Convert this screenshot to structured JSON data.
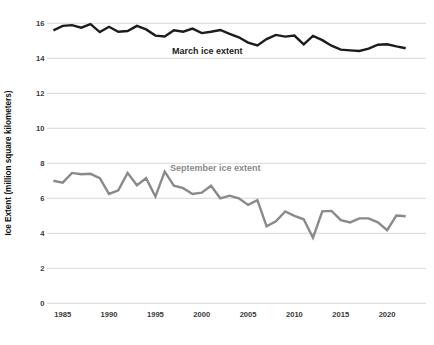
{
  "chart_data": {
    "type": "line",
    "title": "",
    "xlabel": "",
    "ylabel": "Ice Extent (million square kilometers)",
    "ylim": [
      0,
      16
    ],
    "xlim": [
      1983.5,
      2023.5
    ],
    "grid": "horizontal-only",
    "legend_position": "inline-annotations",
    "x": [
      1984,
      1985,
      1986,
      1987,
      1988,
      1989,
      1990,
      1991,
      1992,
      1993,
      1994,
      1995,
      1996,
      1997,
      1998,
      1999,
      2000,
      2001,
      2002,
      2003,
      2004,
      2005,
      2006,
      2007,
      2008,
      2009,
      2010,
      2011,
      2012,
      2013,
      2014,
      2015,
      2016,
      2017,
      2018,
      2019,
      2020,
      2021,
      2022
    ],
    "series": [
      {
        "name": "March ice extent",
        "color": "#1c1c1c",
        "values": [
          15.6,
          15.85,
          15.9,
          15.75,
          15.95,
          15.5,
          15.8,
          15.52,
          15.56,
          15.85,
          15.65,
          15.3,
          15.25,
          15.6,
          15.52,
          15.7,
          15.44,
          15.52,
          15.62,
          15.4,
          15.2,
          14.9,
          14.74,
          15.1,
          15.34,
          15.24,
          15.3,
          14.8,
          15.28,
          15.04,
          14.72,
          14.5,
          14.45,
          14.42,
          14.55,
          14.78,
          14.8,
          14.68,
          14.58
        ]
      },
      {
        "name": "September ice extent",
        "color": "#8a8a8a",
        "values": [
          7.0,
          6.9,
          7.45,
          7.38,
          7.4,
          7.15,
          6.25,
          6.45,
          7.45,
          6.75,
          7.15,
          6.1,
          7.52,
          6.72,
          6.58,
          6.25,
          6.32,
          6.72,
          6.0,
          6.15,
          6.0,
          5.62,
          5.9,
          4.4,
          4.68,
          5.25,
          5.0,
          4.8,
          3.75,
          5.25,
          5.28,
          4.75,
          4.62,
          4.85,
          4.85,
          4.62,
          4.18,
          5.02,
          4.98
        ]
      }
    ],
    "yticks": {
      "values": [
        0,
        2,
        4,
        6,
        8,
        10,
        12,
        14,
        16
      ],
      "labels": [
        "0",
        "2",
        "4",
        "6",
        "8",
        "10",
        "12",
        "14",
        "16"
      ]
    },
    "xticks": {
      "values": [
        1985,
        1990,
        1995,
        2000,
        2005,
        2010,
        2015,
        2020
      ],
      "labels": [
        "1985",
        "1990",
        "1995",
        "2000",
        "2005",
        "2010",
        "2015",
        "2020"
      ]
    },
    "series_labels": {
      "march": "March ice extent",
      "september": "September ice extent"
    },
    "colors": {
      "march_line": "#1c1c1c",
      "september_line": "#8a8a8a",
      "grid": "#d8d8d8",
      "tick_text": "#3a3a3a",
      "axis_title_text": "#111111",
      "background": "#ffffff"
    }
  }
}
